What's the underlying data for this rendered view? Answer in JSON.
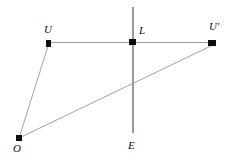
{
  "figure": {
    "type": "geometry-diagram",
    "width": 236,
    "height": 161,
    "background_color": "#ffffff",
    "line_color": "#9a9a9a",
    "marker_color": "#0d0d0d",
    "label_color": "#111111"
  },
  "labels": {
    "u": "U",
    "l": "L",
    "u_prime": "U′",
    "o": "O",
    "e": "E"
  },
  "points": [
    {
      "id": "U",
      "label": "U",
      "x": 49,
      "y": 43,
      "label_x": 44,
      "label_y": 24
    },
    {
      "id": "L",
      "label": "L",
      "x": 133,
      "y": 42,
      "label_x": 139,
      "label_y": 25
    },
    {
      "id": "Up",
      "label": "U′",
      "x": 213,
      "y": 43,
      "label_x": 209,
      "label_y": 21
    },
    {
      "id": "O",
      "label": "O",
      "x": 19,
      "y": 138,
      "label_x": 13,
      "label_y": 143
    },
    {
      "id": "E",
      "label": "E",
      "x": 133,
      "y": 133,
      "label_x": 128,
      "label_y": 140
    }
  ],
  "segments": [
    {
      "id": "horizontal-u-uprime",
      "from": "U",
      "to": "U′",
      "x1": 49,
      "y1": 43,
      "x2": 216,
      "y2": 42
    },
    {
      "id": "vertical-axis-e",
      "from": "top",
      "to": "E",
      "x1": 133,
      "y1": 7,
      "x2": 133,
      "y2": 133
    },
    {
      "id": "ray-o-u",
      "from": "O",
      "to": "U",
      "x1": 19,
      "y1": 138,
      "x2": 49,
      "y2": 43
    },
    {
      "id": "ray-o-uprime",
      "from": "O",
      "to": "U′",
      "x1": 19,
      "y1": 138,
      "x2": 215,
      "y2": 44
    }
  ]
}
